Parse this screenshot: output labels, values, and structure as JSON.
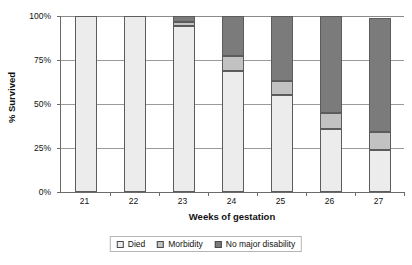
{
  "chart_data": {
    "type": "bar",
    "subtype": "stacked-percent",
    "title": "",
    "xlabel": "Weeks of gestation",
    "ylabel": "% Survived",
    "categories": [
      "21",
      "22",
      "23",
      "24",
      "25",
      "26",
      "27"
    ],
    "ylim": [
      0,
      100
    ],
    "yticks": [
      0,
      25,
      50,
      75,
      100
    ],
    "ytick_labels": [
      "0%",
      "25%",
      "50%",
      "75%",
      "100%"
    ],
    "grid": true,
    "legend_position": "bottom",
    "series": [
      {
        "name": "Died",
        "color": "#ececec",
        "values": [
          100,
          100,
          94.5,
          69,
          55,
          36,
          24
        ]
      },
      {
        "name": "Morbidity",
        "color": "#c2c2c2",
        "values": [
          0,
          0,
          2,
          8,
          8,
          9,
          10
        ]
      },
      {
        "name": "No major disability",
        "color": "#7b7b7b",
        "values": [
          0,
          0,
          3.5,
          23,
          37,
          55,
          65
        ]
      }
    ]
  },
  "axes": {
    "y_title": "% Survived",
    "x_title": "Weeks of gestation",
    "y_ticks": [
      {
        "label": "100%",
        "value": 100
      },
      {
        "label": "75%",
        "value": 75
      },
      {
        "label": "50%",
        "value": 50
      },
      {
        "label": "25%",
        "value": 25
      },
      {
        "label": "0%",
        "value": 0
      }
    ],
    "x_ticks": [
      "21",
      "22",
      "23",
      "24",
      "25",
      "26",
      "27"
    ]
  },
  "legend": {
    "items": [
      {
        "label": "Died",
        "color": "#ececec"
      },
      {
        "label": "Morbidity",
        "color": "#c2c2c2"
      },
      {
        "label": "No major disability",
        "color": "#7b7b7b"
      }
    ]
  },
  "colors": {
    "died": "#ececec",
    "morbidity": "#c2c2c2",
    "no_major_disability": "#7b7b7b",
    "axis": "#6b6b6b",
    "gridline": "#9a9a9a",
    "bar_outline": "#5c5c5c",
    "background": "#ffffff",
    "text": "#111111"
  }
}
